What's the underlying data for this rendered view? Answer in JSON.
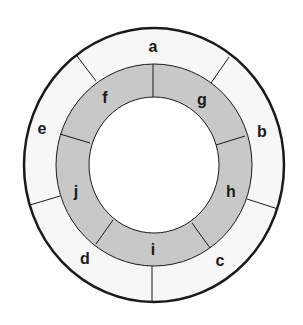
{
  "diagram": {
    "type": "concentric-ring-segments",
    "colors": {
      "outer_ring_fill": "#f7f7f7",
      "middle_ring_fill": "#c8c8c8",
      "center_fill": "#ffffff",
      "stroke": "#1a1a1a"
    },
    "outer_ring": {
      "segments": [
        {
          "label": "a"
        },
        {
          "label": "b"
        },
        {
          "label": "c"
        },
        {
          "label": "d"
        },
        {
          "label": "e"
        }
      ]
    },
    "inner_ring": {
      "segments": [
        {
          "label": "f"
        },
        {
          "label": "g"
        },
        {
          "label": "h"
        },
        {
          "label": "i"
        },
        {
          "label": "j"
        }
      ]
    }
  }
}
